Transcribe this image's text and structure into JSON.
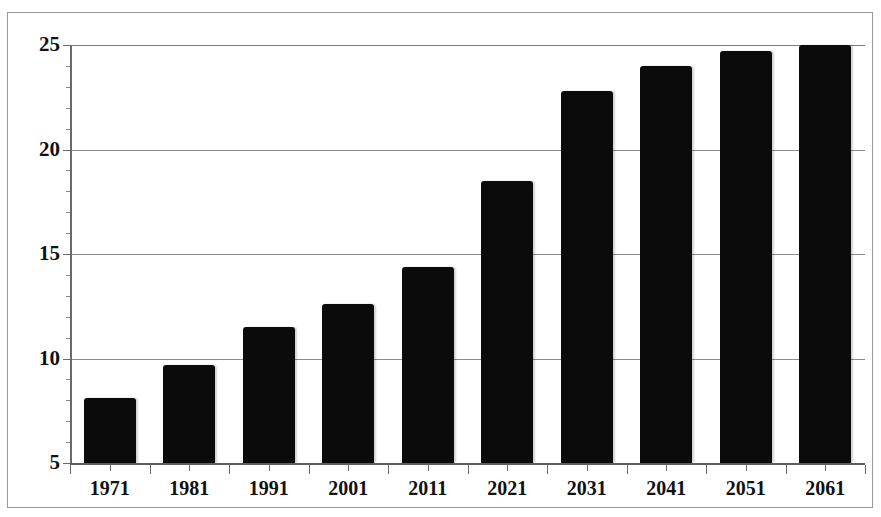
{
  "title": "",
  "chart_data": {
    "type": "bar",
    "title": "",
    "subtitle": "",
    "xlabel": "",
    "ylabel": "",
    "categories": [
      "1971",
      "1981",
      "1991",
      "2001",
      "2011",
      "2021",
      "2031",
      "2041",
      "2051",
      "2061"
    ],
    "values": [
      8.1,
      9.7,
      11.5,
      12.6,
      14.4,
      18.5,
      22.8,
      24.0,
      24.7,
      25.0
    ],
    "ylim": [
      5,
      25
    ],
    "yticks": [
      5,
      10,
      15,
      20,
      25
    ],
    "ytick_labels": [
      "5",
      "10",
      "15",
      "20",
      "25"
    ],
    "grid": true,
    "legend": false,
    "legend_position": "none",
    "series": [
      {
        "name": "Population",
        "color": "#0b0b0b",
        "values": [
          8.1,
          9.7,
          11.5,
          12.6,
          14.4,
          18.5,
          22.8,
          24.0,
          24.7,
          25.0
        ]
      }
    ],
    "bar_color": "#0b0b0b",
    "plot_background": "#ffffff",
    "frame_color": "#9a9a9a",
    "gridline_color": "#8c8c8c",
    "axis_color": "#6a6a6a"
  }
}
